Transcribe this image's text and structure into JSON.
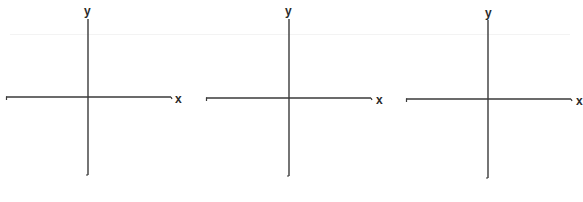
{
  "diagram": {
    "type": "blank-cartesian-axes",
    "panels": [
      {
        "id": "panel-1",
        "x_label": "x",
        "y_label": "y",
        "origin": [
          88,
          97
        ],
        "x_axis": {
          "from": 6,
          "to": 171,
          "y": 97
        },
        "y_axis": {
          "from": 19,
          "to": 175,
          "x": 88
        },
        "x_label_pos": [
          176,
          93
        ],
        "y_label_pos": [
          84,
          5
        ]
      },
      {
        "id": "panel-2",
        "x_label": "x",
        "y_label": "y",
        "origin": [
          289,
          98
        ],
        "x_axis": {
          "from": 206,
          "to": 371,
          "y": 98
        },
        "y_axis": {
          "from": 19,
          "to": 176,
          "x": 289
        },
        "x_label_pos": [
          376,
          94
        ],
        "y_label_pos": [
          285,
          5
        ]
      },
      {
        "id": "panel-3",
        "x_label": "x",
        "y_label": "y",
        "origin": [
          488,
          99
        ],
        "x_axis": {
          "from": 406,
          "to": 571,
          "y": 99
        },
        "y_axis": {
          "from": 20,
          "to": 178,
          "x": 488
        },
        "x_label_pos": [
          576,
          95
        ],
        "y_label_pos": [
          485,
          7
        ]
      }
    ],
    "colors": {
      "axis": "#3a3a3a",
      "label": "#2a2a2a",
      "background": "#ffffff"
    }
  }
}
